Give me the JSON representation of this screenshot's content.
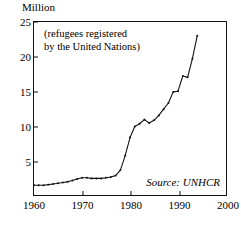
{
  "chart_data": {
    "type": "line",
    "title": "",
    "xlabel": "",
    "ylabel": "Million",
    "annotation": "(refugees registered\nby the United Nations)",
    "source": "Source: UNHCR",
    "xlim": [
      1960,
      2000
    ],
    "ylim": [
      0,
      25
    ],
    "xticks": [
      1960,
      1970,
      1980,
      1990,
      2000
    ],
    "yticks": [
      5,
      10,
      15,
      20,
      25
    ],
    "grid": false,
    "legend": false,
    "line_color": "#111111",
    "series": [
      {
        "name": "Refugees registered by the United Nations",
        "x": [
          1960,
          1961,
          1962,
          1963,
          1964,
          1965,
          1966,
          1967,
          1968,
          1969,
          1970,
          1971,
          1972,
          1973,
          1974,
          1975,
          1976,
          1977,
          1978,
          1979,
          1980,
          1981,
          1982,
          1983,
          1984,
          1985,
          1986,
          1987,
          1988,
          1989,
          1990,
          1991,
          1992,
          1993,
          1994
        ],
        "values": [
          1.4,
          1.4,
          1.4,
          1.5,
          1.6,
          1.7,
          1.8,
          1.9,
          2.1,
          2.3,
          2.5,
          2.5,
          2.4,
          2.4,
          2.4,
          2.5,
          2.6,
          2.8,
          3.6,
          5.7,
          8.3,
          9.9,
          10.3,
          10.9,
          10.4,
          10.8,
          11.5,
          12.4,
          13.3,
          14.9,
          15.0,
          17.2,
          17.0,
          19.7,
          23.0
        ]
      }
    ]
  }
}
